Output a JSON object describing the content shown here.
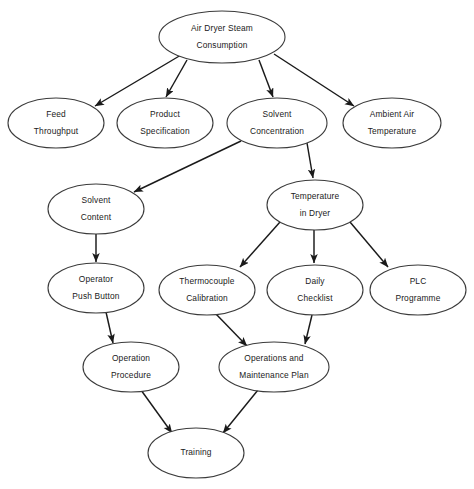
{
  "diagram": {
    "canvas": {
      "width": 474,
      "height": 489
    },
    "colors": {
      "background": "#ffffff",
      "node_fill": "#ffffff",
      "node_stroke": "#3b3b3b",
      "edge_stroke": "#1a1a1a",
      "text": "#1a1a1a"
    },
    "nodes": [
      {
        "id": "air-dryer-steam-consumption",
        "line1": "Air Dryer Steam",
        "line2": "Consumption",
        "cx": 222,
        "cy": 37,
        "rx": 63,
        "ry": 26
      },
      {
        "id": "feed-throughput",
        "line1": "Feed",
        "line2": "Throughput",
        "cx": 56,
        "cy": 123,
        "rx": 48,
        "ry": 25
      },
      {
        "id": "product-specification",
        "line1": "Product",
        "line2": "Specification",
        "cx": 165,
        "cy": 123,
        "rx": 48,
        "ry": 25
      },
      {
        "id": "solvent-concentration",
        "line1": "Solvent",
        "line2": "Concentration",
        "cx": 277,
        "cy": 123,
        "rx": 50,
        "ry": 25
      },
      {
        "id": "ambient-air-temperature",
        "line1": "Ambient Air",
        "line2": "Temperature",
        "cx": 392,
        "cy": 123,
        "rx": 49,
        "ry": 25
      },
      {
        "id": "solvent-content",
        "line1": "Solvent",
        "line2": "Content",
        "cx": 96,
        "cy": 209,
        "rx": 48,
        "ry": 25
      },
      {
        "id": "temperature-in-dryer",
        "line1": "Temperature",
        "line2": "in Dryer",
        "cx": 315,
        "cy": 205,
        "rx": 48,
        "ry": 25
      },
      {
        "id": "operator-push-button",
        "line1": "Operator",
        "line2": "Push Button",
        "cx": 96,
        "cy": 288,
        "rx": 48,
        "ry": 25
      },
      {
        "id": "thermocouple-calibration",
        "line1": "Thermocouple",
        "line2": "Calibration",
        "cx": 207,
        "cy": 290,
        "rx": 48,
        "ry": 25
      },
      {
        "id": "daily-checklist",
        "line1": "Daily",
        "line2": "Checklist",
        "cx": 315,
        "cy": 290,
        "rx": 48,
        "ry": 25
      },
      {
        "id": "plc-programme",
        "line1": "PLC",
        "line2": "Programme",
        "cx": 418,
        "cy": 290,
        "rx": 48,
        "ry": 25
      },
      {
        "id": "operation-procedure",
        "line1": "Operation",
        "line2": "Procedure",
        "cx": 131,
        "cy": 367,
        "rx": 48,
        "ry": 25
      },
      {
        "id": "operations-and-maintenance-plan",
        "line1": "Operations and",
        "line2": "Maintenance Plan",
        "cx": 274,
        "cy": 367,
        "rx": 55,
        "ry": 25
      },
      {
        "id": "training",
        "line1": "Training",
        "line2": "",
        "cx": 196,
        "cy": 453,
        "rx": 48,
        "ry": 25
      }
    ],
    "edges": [
      {
        "id": "edge-steam-to-feed",
        "from": "air-dryer-steam-consumption",
        "to": "feed-throughput",
        "x1": 181,
        "y1": 55,
        "x2": 95,
        "y2": 106
      },
      {
        "id": "edge-steam-to-product",
        "from": "air-dryer-steam-consumption",
        "to": "product-specification",
        "x1": 187,
        "y1": 60,
        "x2": 166,
        "y2": 97
      },
      {
        "id": "edge-steam-to-solvent-conc",
        "from": "air-dryer-steam-consumption",
        "to": "solvent-concentration",
        "x1": 259,
        "y1": 60,
        "x2": 273,
        "y2": 97
      },
      {
        "id": "edge-steam-to-ambient",
        "from": "air-dryer-steam-consumption",
        "to": "ambient-air-temperature",
        "x1": 274,
        "y1": 54,
        "x2": 354,
        "y2": 106
      },
      {
        "id": "edge-solvent-conc-to-solvent-content",
        "from": "solvent-concentration",
        "to": "solvent-content",
        "x1": 241,
        "y1": 141,
        "x2": 134,
        "y2": 192
      },
      {
        "id": "edge-solvent-conc-to-temp-dryer",
        "from": "solvent-concentration",
        "to": "temperature-in-dryer",
        "x1": 307,
        "y1": 143,
        "x2": 313,
        "y2": 178
      },
      {
        "id": "edge-temp-dryer-to-thermocouple",
        "from": "temperature-in-dryer",
        "to": "thermocouple-calibration",
        "x1": 280,
        "y1": 222,
        "x2": 240,
        "y2": 267
      },
      {
        "id": "edge-temp-dryer-to-daily-checklist",
        "from": "temperature-in-dryer",
        "to": "daily-checklist",
        "x1": 314,
        "y1": 230,
        "x2": 314,
        "y2": 263
      },
      {
        "id": "edge-temp-dryer-to-plc",
        "from": "temperature-in-dryer",
        "to": "plc-programme",
        "x1": 350,
        "y1": 222,
        "x2": 388,
        "y2": 267
      },
      {
        "id": "edge-solvent-content-to-operator",
        "from": "solvent-content",
        "to": "operator-push-button",
        "x1": 96,
        "y1": 234,
        "x2": 96,
        "y2": 262
      },
      {
        "id": "edge-operator-to-operation-procedure",
        "from": "operator-push-button",
        "to": "operation-procedure",
        "x1": 106,
        "y1": 312,
        "x2": 113,
        "y2": 343
      },
      {
        "id": "edge-thermocouple-to-ops-plan",
        "from": "thermocouple-calibration",
        "to": "operations-and-maintenance-plan",
        "x1": 215,
        "y1": 313,
        "x2": 247,
        "y2": 346
      },
      {
        "id": "edge-daily-checklist-to-ops-plan",
        "from": "daily-checklist",
        "to": "operations-and-maintenance-plan",
        "x1": 312,
        "y1": 315,
        "x2": 305,
        "y2": 344
      },
      {
        "id": "edge-operation-procedure-to-training",
        "from": "operation-procedure",
        "to": "training",
        "x1": 141,
        "y1": 390,
        "x2": 172,
        "y2": 433
      },
      {
        "id": "edge-ops-plan-to-training",
        "from": "operations-and-maintenance-plan",
        "to": "training",
        "x1": 258,
        "y1": 390,
        "x2": 223,
        "y2": 433
      }
    ]
  },
  "chart_data": {
    "type": "diagram",
    "levels": [
      [
        "Air Dryer Steam Consumption"
      ],
      [
        "Feed Throughput",
        "Product Specification",
        "Solvent Concentration",
        "Ambient Air Temperature"
      ],
      [
        "Solvent Content",
        "Temperature in Dryer"
      ],
      [
        "Operator Push Button",
        "Thermocouple Calibration",
        "Daily Checklist",
        "PLC Programme"
      ],
      [
        "Operation Procedure",
        "Operations and Maintenance Plan"
      ],
      [
        "Training"
      ]
    ],
    "relations": [
      [
        "Air Dryer Steam Consumption",
        "Feed Throughput"
      ],
      [
        "Air Dryer Steam Consumption",
        "Product Specification"
      ],
      [
        "Air Dryer Steam Consumption",
        "Solvent Concentration"
      ],
      [
        "Air Dryer Steam Consumption",
        "Ambient Air Temperature"
      ],
      [
        "Solvent Concentration",
        "Solvent Content"
      ],
      [
        "Solvent Concentration",
        "Temperature in Dryer"
      ],
      [
        "Solvent Content",
        "Operator Push Button"
      ],
      [
        "Temperature in Dryer",
        "Thermocouple Calibration"
      ],
      [
        "Temperature in Dryer",
        "Daily Checklist"
      ],
      [
        "Temperature in Dryer",
        "PLC Programme"
      ],
      [
        "Operator Push Button",
        "Operation Procedure"
      ],
      [
        "Thermocouple Calibration",
        "Operations and Maintenance Plan"
      ],
      [
        "Daily Checklist",
        "Operations and Maintenance Plan"
      ],
      [
        "Operation Procedure",
        "Training"
      ],
      [
        "Operations and Maintenance Plan",
        "Training"
      ]
    ]
  }
}
